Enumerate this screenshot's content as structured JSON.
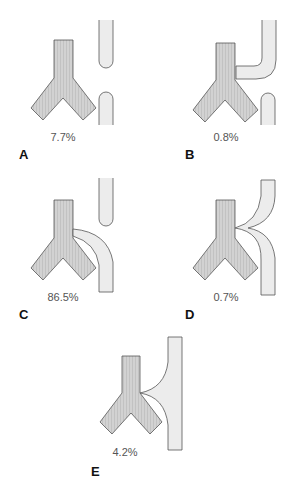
{
  "figure": {
    "colors": {
      "trachea_fill": "#cfcfcf",
      "trachea_stripe": "#bdbdbd",
      "esophagus_fill": "#ececec",
      "outline": "#555555",
      "label": "#555555",
      "letter": "#111111"
    },
    "panels": [
      {
        "letter": "A",
        "percentage": "7.7%",
        "description": "Esophageal atresia without fistula"
      },
      {
        "letter": "B",
        "percentage": "0.8%",
        "description": "Esophageal atresia with proximal fistula"
      },
      {
        "letter": "C",
        "percentage": "86.5%",
        "description": "Esophageal atresia with distal fistula"
      },
      {
        "letter": "D",
        "percentage": "0.7%",
        "description": "Esophageal atresia with proximal and distal fistulas"
      },
      {
        "letter": "E",
        "percentage": "4.2%",
        "description": "H-type fistula without atresia"
      }
    ]
  }
}
